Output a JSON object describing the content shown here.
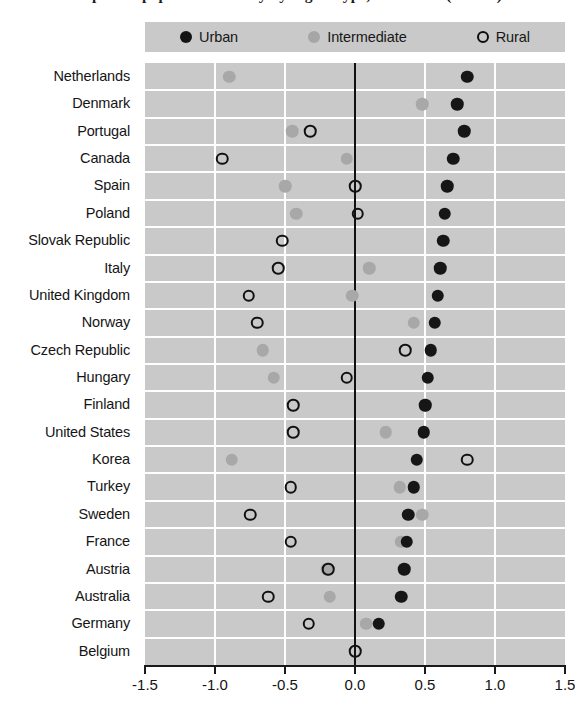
{
  "title": "Impact of population density by region type, 1990-2005 (OECD)",
  "legend": {
    "items": [
      {
        "label": "Urban",
        "marker": "filled-black-circle-icon",
        "color": "#141414"
      },
      {
        "label": "Intermediate",
        "marker": "filled-gray-circle-icon",
        "color": "#a6a6a6"
      },
      {
        "label": "Rural",
        "marker": "hollow-circle-icon",
        "color": "#0d0d0d"
      }
    ]
  },
  "axis": {
    "ticks": [
      "-1.5",
      "-1.0",
      "-0.5",
      "0.0",
      "0.5",
      "1.0",
      "1.5"
    ],
    "tick_values": [
      -1.5,
      -1.0,
      -0.5,
      0.0,
      0.5,
      1.0,
      1.5
    ],
    "xmin": -1.5,
    "xmax": 1.5,
    "zero_reference": 0.0
  },
  "chart_data": {
    "type": "scatter",
    "title": "Impact of population density by region type, 1990-2005 (OECD)",
    "xlabel": "",
    "ylabel": "",
    "xlim": [
      -1.5,
      1.5
    ],
    "grid": true,
    "legend_position": "top",
    "orientation": "horizontal-dot-plot",
    "categories": [
      "Netherlands",
      "Denmark",
      "Portugal",
      "Canada",
      "Spain",
      "Poland",
      "Slovak Republic",
      "Italy",
      "United Kingdom",
      "Norway",
      "Czech Republic",
      "Hungary",
      "Finland",
      "United States",
      "Korea",
      "Turkey",
      "Sweden",
      "France",
      "Austria",
      "Australia",
      "Germany",
      "Belgium"
    ],
    "series": [
      {
        "name": "Urban",
        "values": [
          0.8,
          0.73,
          0.78,
          0.7,
          0.66,
          0.64,
          0.63,
          0.61,
          0.59,
          0.57,
          0.54,
          0.52,
          0.5,
          0.49,
          0.44,
          0.42,
          0.38,
          0.37,
          0.35,
          0.33,
          0.17,
          null
        ]
      },
      {
        "name": "Intermediate",
        "values": [
          -0.9,
          0.48,
          -0.45,
          -0.06,
          -0.5,
          -0.42,
          null,
          0.1,
          -0.02,
          0.42,
          -0.66,
          -0.58,
          0.5,
          0.22,
          -0.88,
          0.32,
          0.48,
          0.33,
          -0.2,
          -0.18,
          0.08,
          null
        ]
      },
      {
        "name": "Rural",
        "values": [
          null,
          null,
          -0.32,
          -0.95,
          0.0,
          0.02,
          -0.52,
          -0.55,
          -0.76,
          -0.7,
          0.36,
          -0.06,
          -0.44,
          -0.44,
          0.8,
          -0.46,
          -0.75,
          -0.46,
          -0.19,
          -0.62,
          -0.33,
          0.0
        ]
      }
    ]
  }
}
